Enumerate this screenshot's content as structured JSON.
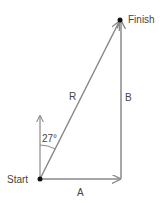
{
  "diagram": {
    "type": "vector-addition",
    "labels": {
      "start": "Start",
      "finish": "Finish",
      "resultant": "R",
      "horizontal": "A",
      "vertical": "B",
      "angle": "27°"
    },
    "colors": {
      "line": "#8a8a8a",
      "dot": "#111111",
      "text": "#444444"
    }
  }
}
